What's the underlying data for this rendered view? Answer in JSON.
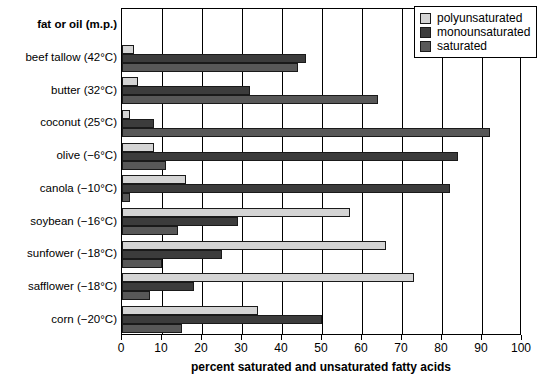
{
  "chart_data": {
    "type": "bar",
    "orientation": "horizontal",
    "title": "",
    "xlabel": "percent saturated and unsaturated fatty acids",
    "ylabel": "fat or oil (m.p.)",
    "xlim": [
      0,
      100
    ],
    "xticks": [
      0,
      10,
      20,
      30,
      40,
      50,
      60,
      70,
      80,
      90,
      100
    ],
    "xticklabels": [
      "0",
      "10",
      "20",
      "30",
      "40",
      "50",
      "60",
      "70",
      "80",
      "90",
      "100"
    ],
    "grid": "vertical",
    "legend_position": "top-right",
    "categories": [
      "beef tallow (42°C)",
      "butter (32°C)",
      "coconut (25°C)",
      "olive (−6°C)",
      "canola (−10°C)",
      "soybean (−16°C)",
      "sunfower (−18°C)",
      "safflower (−18°C)",
      "corn (−20°C)"
    ],
    "series": [
      {
        "name": "polyunsaturated",
        "color": "#d4d4d4",
        "values": [
          3,
          4,
          2,
          8,
          16,
          57,
          66,
          73,
          34
        ]
      },
      {
        "name": "monounsaturated",
        "color": "#3c3c3c",
        "values": [
          46,
          32,
          8,
          84,
          82,
          29,
          25,
          18,
          50
        ]
      },
      {
        "name": "saturated",
        "color": "#585858",
        "values": [
          44,
          64,
          92,
          11,
          2,
          14,
          10,
          7,
          15
        ]
      }
    ]
  },
  "axis": {
    "category_header": "fat or oil (m.p.)",
    "xlabel": "percent saturated and unsaturated fatty acids"
  },
  "legend": {
    "items": [
      {
        "label": "polyunsaturated",
        "color": "#d4d4d4"
      },
      {
        "label": "monounsaturated",
        "color": "#3c3c3c"
      },
      {
        "label": "saturated",
        "color": "#585858"
      }
    ]
  }
}
